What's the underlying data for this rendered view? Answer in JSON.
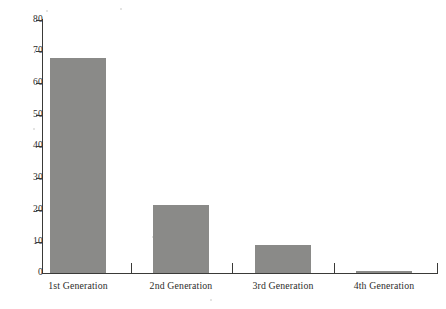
{
  "chart_data": {
    "type": "bar",
    "title": "",
    "subtitle": "",
    "xlabel": "",
    "ylabel": "",
    "categories": [
      "1st Generation",
      "2nd Generation",
      "3rd Generation",
      "4th Generation"
    ],
    "values": [
      68,
      21.5,
      8.7,
      0.7
    ],
    "series": [
      {
        "name": "",
        "values": [
          68,
          21.5,
          8.7,
          0.7
        ]
      }
    ],
    "ylim": [
      0,
      80
    ],
    "yticks": [
      0,
      10,
      20,
      30,
      40,
      50,
      60,
      70,
      80
    ],
    "ytick_labels": [
      "0",
      "10",
      "20",
      "30",
      "40",
      "50",
      "60",
      "70",
      "80"
    ],
    "xtick_labels": [
      "1st Generation",
      "2nd Generation",
      "3rd Generation",
      "4th Generation"
    ],
    "grid": false,
    "legend": false,
    "legend_position": "none",
    "bar_color": "#8a8a88",
    "axis_color": "#3a3a38",
    "background_color": "#ffffff",
    "annotations": []
  },
  "axis": {
    "y_labels": {
      "t80": "80",
      "t70": "70",
      "t60": "60",
      "t50": "50",
      "t40": "40",
      "t30": "30",
      "t20": "20",
      "t10": "10",
      "t0": "0"
    },
    "x_labels": {
      "c0": "1st Generation",
      "c1": "2nd Generation",
      "c2": "3rd Generation",
      "c3": "4th Generation"
    }
  }
}
